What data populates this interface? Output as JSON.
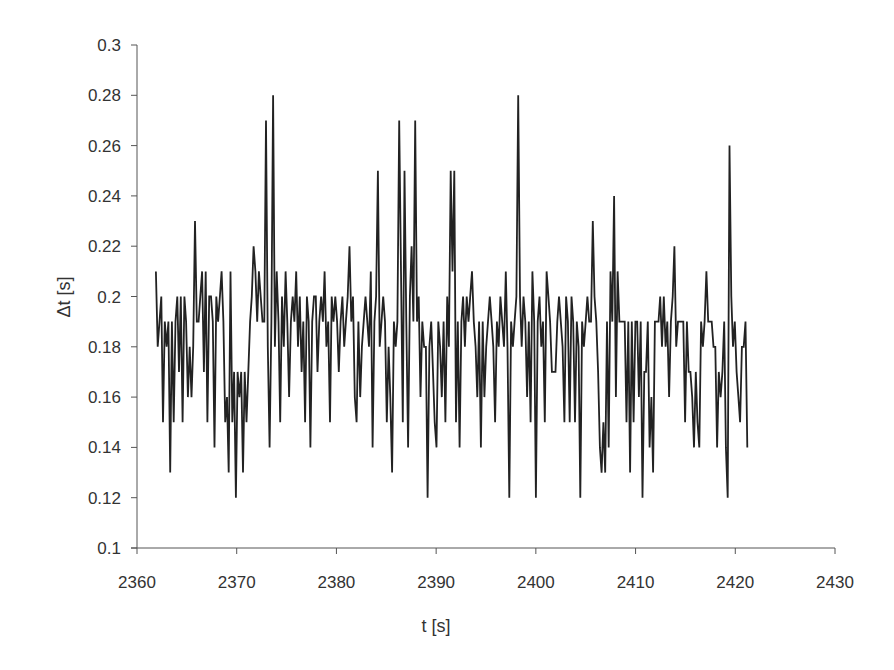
{
  "chart_data": {
    "type": "line",
    "title": "",
    "xlabel": "t [s]",
    "ylabel": "Δt [s]",
    "xlim": [
      2360,
      2430
    ],
    "ylim": [
      0.1,
      0.3
    ],
    "grid": false,
    "legend": null,
    "x_ticks": [
      2360,
      2370,
      2380,
      2390,
      2400,
      2410,
      2420,
      2430
    ],
    "x_tick_labels": [
      "2360",
      "2370",
      "2380",
      "2390",
      "2400",
      "2410",
      "2420",
      "2430"
    ],
    "y_ticks": [
      0.1,
      0.12,
      0.14,
      0.16,
      0.18,
      0.2,
      0.22,
      0.24,
      0.26,
      0.28,
      0.3
    ],
    "y_tick_labels": [
      "0.1",
      "0.12",
      "0.14",
      "0.16",
      "0.18",
      "0.2",
      "0.22",
      "0.24",
      "0.26",
      "0.28",
      "0.3"
    ],
    "line_color": "#222222",
    "series": [
      {
        "name": "Δt",
        "x_start": 2361.9,
        "values": [
          0.21,
          0.18,
          0.19,
          0.2,
          0.15,
          0.19,
          0.18,
          0.19,
          0.13,
          0.19,
          0.15,
          0.19,
          0.2,
          0.17,
          0.2,
          0.15,
          0.2,
          0.19,
          0.16,
          0.18,
          0.16,
          0.18,
          0.23,
          0.19,
          0.19,
          0.2,
          0.21,
          0.17,
          0.21,
          0.15,
          0.2,
          0.2,
          0.19,
          0.14,
          0.2,
          0.19,
          0.2,
          0.21,
          0.19,
          0.15,
          0.16,
          0.13,
          0.21,
          0.15,
          0.17,
          0.12,
          0.17,
          0.16,
          0.17,
          0.13,
          0.17,
          0.15,
          0.17,
          0.19,
          0.2,
          0.22,
          0.21,
          0.19,
          0.21,
          0.2,
          0.19,
          0.19,
          0.27,
          0.18,
          0.14,
          0.19,
          0.28,
          0.18,
          0.21,
          0.19,
          0.15,
          0.2,
          0.18,
          0.21,
          0.19,
          0.16,
          0.19,
          0.2,
          0.19,
          0.21,
          0.18,
          0.2,
          0.17,
          0.19,
          0.15,
          0.2,
          0.19,
          0.14,
          0.19,
          0.2,
          0.2,
          0.17,
          0.19,
          0.2,
          0.19,
          0.21,
          0.18,
          0.19,
          0.15,
          0.2,
          0.19,
          0.2,
          0.19,
          0.17,
          0.19,
          0.2,
          0.18,
          0.19,
          0.2,
          0.22,
          0.19,
          0.2,
          0.16,
          0.15,
          0.19,
          0.16,
          0.18,
          0.19,
          0.2,
          0.19,
          0.18,
          0.21,
          0.14,
          0.19,
          0.2,
          0.25,
          0.18,
          0.19,
          0.2,
          0.19,
          0.15,
          0.18,
          0.16,
          0.13,
          0.19,
          0.18,
          0.19,
          0.27,
          0.21,
          0.15,
          0.25,
          0.19,
          0.14,
          0.2,
          0.22,
          0.19,
          0.27,
          0.19,
          0.2,
          0.16,
          0.19,
          0.18,
          0.18,
          0.12,
          0.18,
          0.19,
          0.17,
          0.15,
          0.14,
          0.19,
          0.18,
          0.16,
          0.19,
          0.15,
          0.2,
          0.18,
          0.25,
          0.21,
          0.25,
          0.15,
          0.19,
          0.14,
          0.19,
          0.2,
          0.18,
          0.2,
          0.19,
          0.2,
          0.21,
          0.19,
          0.18,
          0.16,
          0.19,
          0.14,
          0.19,
          0.16,
          0.18,
          0.19,
          0.2,
          0.19,
          0.18,
          0.15,
          0.19,
          0.18,
          0.2,
          0.19,
          0.18,
          0.21,
          0.18,
          0.12,
          0.19,
          0.18,
          0.19,
          0.2,
          0.28,
          0.2,
          0.18,
          0.2,
          0.19,
          0.16,
          0.19,
          0.15,
          0.21,
          0.19,
          0.12,
          0.19,
          0.2,
          0.18,
          0.19,
          0.15,
          0.21,
          0.2,
          0.19,
          0.17,
          0.17,
          0.17,
          0.19,
          0.2,
          0.19,
          0.18,
          0.15,
          0.2,
          0.19,
          0.15,
          0.2,
          0.19,
          0.15,
          0.19,
          0.18,
          0.12,
          0.19,
          0.18,
          0.19,
          0.2,
          0.19,
          0.19,
          0.23,
          0.2,
          0.19,
          0.17,
          0.14,
          0.13,
          0.15,
          0.13,
          0.19,
          0.14,
          0.21,
          0.19,
          0.24,
          0.16,
          0.21,
          0.19,
          0.19,
          0.19,
          0.19,
          0.15,
          0.19,
          0.13,
          0.19,
          0.15,
          0.19,
          0.19,
          0.16,
          0.19,
          0.12,
          0.17,
          0.17,
          0.19,
          0.14,
          0.16,
          0.13,
          0.19,
          0.19,
          0.19,
          0.2,
          0.18,
          0.2,
          0.18,
          0.19,
          0.16,
          0.19,
          0.2,
          0.22,
          0.18,
          0.19,
          0.19,
          0.19,
          0.19,
          0.15,
          0.19,
          0.17,
          0.17,
          0.16,
          0.14,
          0.17,
          0.15,
          0.14,
          0.19,
          0.18,
          0.19,
          0.21,
          0.19,
          0.19,
          0.19,
          0.18,
          0.18,
          0.14,
          0.17,
          0.16,
          0.17,
          0.19,
          0.14,
          0.12,
          0.26,
          0.2,
          0.18,
          0.19,
          0.17,
          0.16,
          0.15,
          0.18,
          0.18,
          0.19,
          0.14
        ],
        "x_end": 2421.2
      }
    ]
  }
}
